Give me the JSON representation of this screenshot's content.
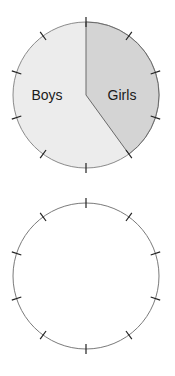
{
  "chart_data": [
    {
      "type": "pie",
      "title": "",
      "categories": [
        "Girls",
        "Boys"
      ],
      "values": [
        40,
        60
      ],
      "colors": {
        "Girls": "#d4d4d4",
        "Boys": "#ececec"
      },
      "start_angle": "top (12 o'clock), clockwise",
      "tick_marks": 10,
      "labels_inside": true
    },
    {
      "type": "pie",
      "title": "",
      "categories": [],
      "values": [],
      "tick_marks": 10,
      "note": "blank circle with 10 evenly spaced tick marks"
    }
  ],
  "labels": {
    "boys": "Boys",
    "girls": "Girls"
  }
}
